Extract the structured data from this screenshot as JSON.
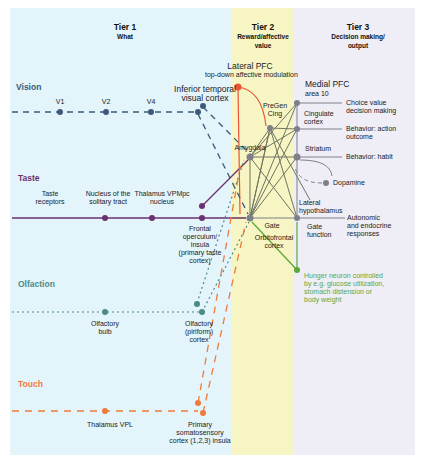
{
  "colors": {
    "tier1_bg": "#e3f4fb",
    "tier2_bg": "#f7f5c4",
    "tier3_bg": "#efedf6",
    "vision": "#3d5a7a",
    "taste": "#6a2f6e",
    "olfaction": "#4c8a88",
    "touch": "#f07a3c",
    "lateral_pfc": "#e8533a",
    "tier3_lines": "#7d8088",
    "convergence": "#6e7560",
    "hunger": "#5ba83a"
  },
  "tiers": [
    {
      "title": "Tier 1",
      "subtitle": "What"
    },
    {
      "title": "Tier 2",
      "subtitle_line1": "Reward/affective",
      "subtitle_line2": "value"
    },
    {
      "title": "Tier 3",
      "subtitle_line1": "Decision making/",
      "subtitle_line2": "output"
    }
  ],
  "modalities": {
    "vision": "Vision",
    "taste": "Taste",
    "olfaction": "Olfaction",
    "touch": "Touch"
  },
  "nodes": {
    "v1": "V1",
    "v2": "V2",
    "v4": "V4",
    "itc_line1": "Inferior temporal",
    "itc_line2": "visual cortex",
    "taste_receptors_line1": "Taste",
    "taste_receptors_line2": "receptors",
    "nts_line1": "Nucleus of the",
    "nts_line2": "solitary tract",
    "vpmpc_line1": "Thalamus VPMpc",
    "vpmpc_line2": "nucleus",
    "insula_lines": [
      "Frontal",
      "operculum/",
      "insula",
      "(primary taste",
      "cortex)"
    ],
    "olf_bulb_line1": "Olfactory",
    "olf_bulb_line2": "bulb",
    "piriform_lines": [
      "Olfactory",
      "(piriform)",
      "cortex"
    ],
    "vpl": "Thalamus VPL",
    "somato_lines": [
      "Primary",
      "somatosensory",
      "cortex (1,2,3) insula"
    ],
    "lateral_pfc": "Lateral PFC",
    "lateral_pfc_sub": "top-down affective modulation",
    "pregen_line1": "PreGen",
    "pregen_line2": "Cing",
    "amygdala": "Amygdala",
    "gate": "Gate",
    "ofc_line1": "Orbitofrontal",
    "ofc_line2": "cortex",
    "medial_pfc": "Medial PFC",
    "medial_pfc_sub": "area 10",
    "cingulate_line1": "Cingulate",
    "cingulate_line2": "cortex",
    "striatum": "Striatum",
    "dopamine": "Dopamine",
    "lat_hypo_line1": "Lateral",
    "lat_hypo_line2": "hypothalamus",
    "gate_function_line1": "Gate",
    "gate_function_line2": "function"
  },
  "outputs": {
    "choice_line1": "Choice value",
    "choice_line2": "decision making",
    "action_line1": "Behavior: action",
    "action_line2": "outcome",
    "habit": "Behavior: habit",
    "autonomic_lines": [
      "Autonomic",
      "and endocrine",
      "responses"
    ]
  },
  "hunger_lines": [
    "Hunger neuron controlled",
    "by e.g. glucose utilization,",
    "stomach distension or",
    "body weight"
  ]
}
